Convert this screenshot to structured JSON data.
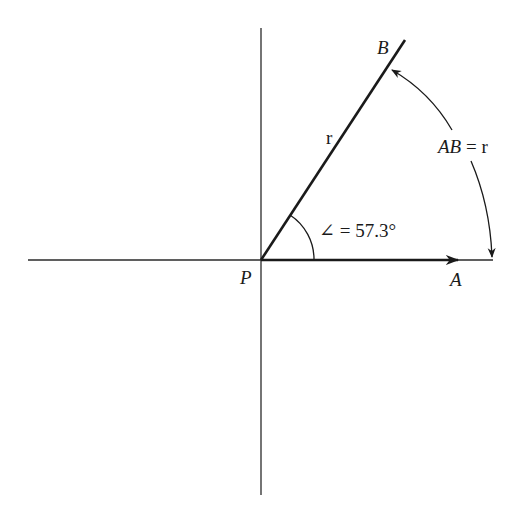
{
  "diagram": {
    "type": "radian-definition",
    "colors": {
      "stroke": "#1a1a1a",
      "background": "#ffffff"
    },
    "points": {
      "origin": {
        "label": "P",
        "x": 261,
        "y": 260
      },
      "a": {
        "label": "A",
        "x": 493,
        "y": 260
      },
      "b": {
        "label": "B",
        "x": 405,
        "y": 40
      }
    },
    "labels": {
      "p": "P",
      "a": "A",
      "b": "B",
      "radius": "r",
      "angle": "∠ = 57.3°",
      "arc_ab": "AB",
      "arc_eq": " = r"
    }
  }
}
